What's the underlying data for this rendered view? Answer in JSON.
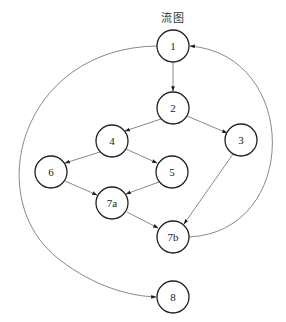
{
  "title": "流图",
  "diagram": {
    "type": "directed-flow-graph",
    "node_radius": 16,
    "stroke_color": "#222222",
    "edge_color": "#7a7a7a",
    "nodes": [
      {
        "id": "1",
        "label": "1",
        "x": 173,
        "y": 46
      },
      {
        "id": "2",
        "label": "2",
        "x": 173,
        "y": 108
      },
      {
        "id": "3",
        "label": "3",
        "x": 241,
        "y": 140
      },
      {
        "id": "4",
        "label": "4",
        "x": 112,
        "y": 141
      },
      {
        "id": "5",
        "label": "5",
        "x": 172,
        "y": 172
      },
      {
        "id": "6",
        "label": "6",
        "x": 51,
        "y": 172
      },
      {
        "id": "7a",
        "label": "7a",
        "x": 112,
        "y": 203
      },
      {
        "id": "7b",
        "label": "7b",
        "x": 173,
        "y": 237
      },
      {
        "id": "8",
        "label": "8",
        "x": 173,
        "y": 297
      }
    ],
    "edges": [
      {
        "from": "1",
        "to": "2",
        "shape": "straight"
      },
      {
        "from": "2",
        "to": "4",
        "shape": "straight"
      },
      {
        "from": "2",
        "to": "3",
        "shape": "straight"
      },
      {
        "from": "4",
        "to": "6",
        "shape": "straight"
      },
      {
        "from": "4",
        "to": "5",
        "shape": "straight"
      },
      {
        "from": "6",
        "to": "7a",
        "shape": "straight"
      },
      {
        "from": "5",
        "to": "7a",
        "shape": "straight"
      },
      {
        "from": "7a",
        "to": "7b",
        "shape": "straight"
      },
      {
        "from": "3",
        "to": "7b",
        "shape": "straight"
      },
      {
        "from": "7b",
        "to": "1",
        "shape": "arc-right"
      },
      {
        "from": "1",
        "to": "8",
        "shape": "arc-left"
      }
    ]
  }
}
